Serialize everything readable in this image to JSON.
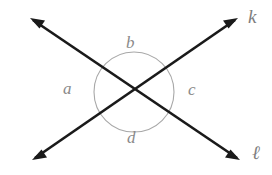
{
  "figure": {
    "background_color": "#ffffff",
    "line_color": "#1a1a1a",
    "arc_color": "#a0a0a0",
    "label_color": "#8a8a8a",
    "intersection": {
      "x": 134,
      "y": 92
    },
    "angle_arc": {
      "center_x": 134,
      "center_y": 92,
      "radius": 40
    },
    "lines": [
      {
        "name": "line-k",
        "label": "k",
        "from": {
          "x": 32,
          "y": 160
        },
        "to": {
          "x": 238,
          "y": 18
        },
        "arrowheads": "both"
      },
      {
        "name": "line-l",
        "label": "ℓ",
        "from": {
          "x": 30,
          "y": 18
        },
        "to": {
          "x": 240,
          "y": 160
        },
        "arrowheads": "both"
      }
    ],
    "angles": [
      {
        "name": "angle-a",
        "label": "a",
        "position": "left"
      },
      {
        "name": "angle-b",
        "label": "b",
        "position": "top"
      },
      {
        "name": "angle-c",
        "label": "c",
        "position": "right"
      },
      {
        "name": "angle-d",
        "label": "d",
        "position": "bottom"
      }
    ]
  }
}
